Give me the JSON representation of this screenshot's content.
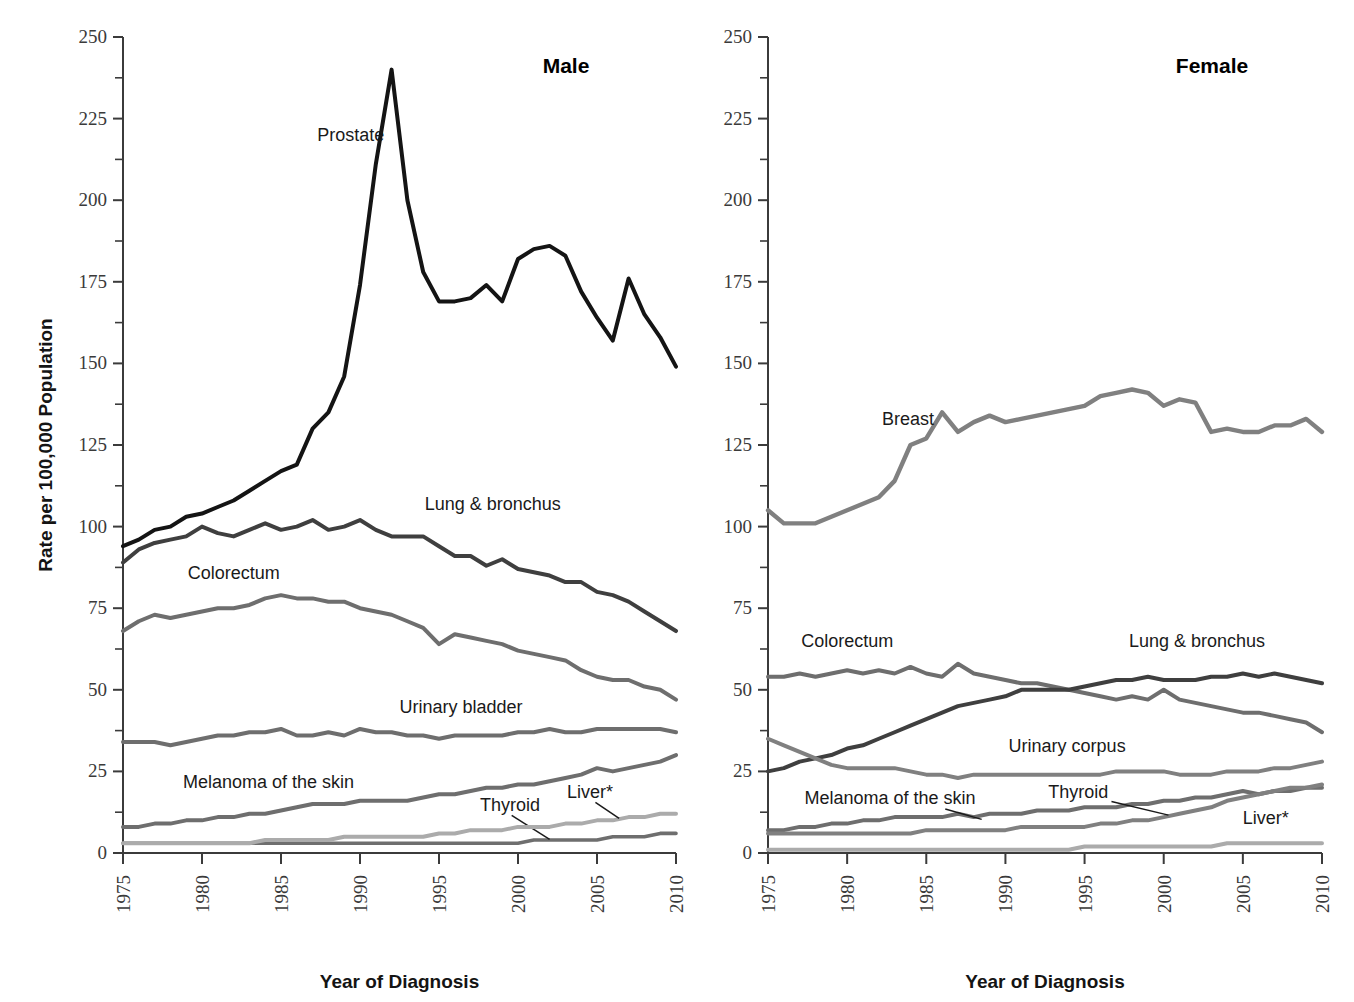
{
  "figure": {
    "y_axis_label": "Rate per 100,000 Population",
    "x_axis_label_male": "Year of Diagnosis",
    "x_axis_label_female": "Year of Diagnosis",
    "panel_title_male": "Male",
    "panel_title_female": "Female"
  },
  "axis": {
    "y_ticks": [
      "0",
      "25",
      "50",
      "75",
      "100",
      "125",
      "150",
      "175",
      "200",
      "225",
      "250"
    ],
    "x_ticks": [
      "1975",
      "1980",
      "1985",
      "1990",
      "1995",
      "2000",
      "2005",
      "2010"
    ]
  },
  "colors": {
    "black": "#141414",
    "dark_gray": "#3f3f3f",
    "mid_gray": "#6e6e6e",
    "gray": "#808080",
    "light_gray": "#9a9a9a",
    "lighter_gray": "#ababab",
    "lightest_gray": "#bdbdbd"
  },
  "chart_data": [
    {
      "type": "line",
      "title": "Male",
      "xlabel": "Year of Diagnosis",
      "ylabel": "Rate per 100,000 Population",
      "xlim": [
        1975,
        2010
      ],
      "ylim": [
        0,
        250
      ],
      "ytick_step": 25,
      "yminor_step": 12.5,
      "xtick_step": 5,
      "grid": false,
      "legend": "inline-annotations",
      "x": [
        1975,
        1976,
        1977,
        1978,
        1979,
        1980,
        1981,
        1982,
        1983,
        1984,
        1985,
        1986,
        1987,
        1988,
        1989,
        1990,
        1991,
        1992,
        1993,
        1994,
        1995,
        1996,
        1997,
        1998,
        1999,
        2000,
        2001,
        2002,
        2003,
        2004,
        2005,
        2006,
        2007,
        2008,
        2009,
        2010
      ],
      "series": [
        {
          "name": "Prostate",
          "color": "#141414",
          "width": 4.0,
          "label_x": 1987.3,
          "label_y": 218,
          "values": [
            94,
            96,
            99,
            100,
            103,
            104,
            106,
            108,
            111,
            114,
            117,
            119,
            130,
            135,
            146,
            174,
            211,
            240,
            200,
            178,
            169,
            169,
            170,
            174,
            169,
            182,
            185,
            186,
            183,
            172,
            164,
            157,
            176,
            165,
            158,
            149
          ]
        },
        {
          "name": "Lung & bronchus",
          "color": "#3f3f3f",
          "width": 4.0,
          "label_x": 1994.1,
          "label_y": 105,
          "values": [
            89,
            93,
            95,
            96,
            97,
            100,
            98,
            97,
            99,
            101,
            99,
            100,
            102,
            99,
            100,
            102,
            99,
            97,
            97,
            97,
            94,
            91,
            91,
            88,
            90,
            87,
            86,
            85,
            83,
            83,
            80,
            79,
            77,
            74,
            71,
            68
          ]
        },
        {
          "name": "Colorectum",
          "color": "#6e6e6e",
          "width": 4.0,
          "label_x": 1979.1,
          "label_y": 84,
          "values": [
            68,
            71,
            73,
            72,
            73,
            74,
            75,
            75,
            76,
            78,
            79,
            78,
            78,
            77,
            77,
            75,
            74,
            73,
            71,
            69,
            64,
            67,
            66,
            65,
            64,
            62,
            61,
            60,
            59,
            56,
            54,
            53,
            53,
            51,
            50,
            47
          ]
        },
        {
          "name": "Urinary bladder",
          "color": "#6e6e6e",
          "width": 4.0,
          "label_x": 1992.5,
          "label_y": 43,
          "values": [
            34,
            34,
            34,
            33,
            34,
            35,
            36,
            36,
            37,
            37,
            38,
            36,
            36,
            37,
            36,
            38,
            37,
            37,
            36,
            36,
            35,
            36,
            36,
            36,
            36,
            37,
            37,
            38,
            37,
            37,
            38,
            38,
            38,
            38,
            38,
            37
          ]
        },
        {
          "name": "Melanoma of the skin",
          "color": "#6e6e6e",
          "width": 4.0,
          "label_x": 1978.8,
          "label_y": 20,
          "values": [
            8,
            8,
            9,
            9,
            10,
            10,
            11,
            11,
            12,
            12,
            13,
            14,
            15,
            15,
            15,
            16,
            16,
            16,
            16,
            17,
            18,
            18,
            19,
            20,
            20,
            21,
            21,
            22,
            23,
            24,
            26,
            25,
            26,
            27,
            28,
            30
          ]
        },
        {
          "name": "Thyroid",
          "color": "#6e6e6e",
          "width": 3.6,
          "label_x": 1997.6,
          "label_y": 13,
          "leader": {
            "x1": 1999.6,
            "y1": 11.5,
            "x2": 2002.0,
            "y2": 4.2
          },
          "values": [
            3,
            3,
            3,
            3,
            3,
            3,
            3,
            3,
            3,
            3,
            3,
            3,
            3,
            3,
            3,
            3,
            3,
            3,
            3,
            3,
            3,
            3,
            3,
            3,
            3,
            3,
            4,
            4,
            4,
            4,
            4,
            5,
            5,
            5,
            6,
            6
          ]
        },
        {
          "name": "Liver*",
          "color": "#ababab",
          "width": 4.0,
          "label_x": 2003.1,
          "label_y": 17,
          "leader": {
            "x1": 2004.9,
            "y1": 15.5,
            "x2": 2006.4,
            "y2": 10.6
          },
          "values": [
            3,
            3,
            3,
            3,
            3,
            3,
            3,
            3,
            3,
            4,
            4,
            4,
            4,
            4,
            5,
            5,
            5,
            5,
            5,
            5,
            6,
            6,
            7,
            7,
            7,
            8,
            8,
            8,
            9,
            9,
            10,
            10,
            11,
            11,
            12,
            12
          ]
        }
      ]
    },
    {
      "type": "line",
      "title": "Female",
      "xlabel": "Year of Diagnosis",
      "ylabel": "Rate per 100,000 Population",
      "xlim": [
        1975,
        2010
      ],
      "ylim": [
        0,
        250
      ],
      "ytick_step": 25,
      "yminor_step": 12.5,
      "xtick_step": 5,
      "grid": false,
      "legend": "inline-annotations",
      "x": [
        1975,
        1976,
        1977,
        1978,
        1979,
        1980,
        1981,
        1982,
        1983,
        1984,
        1985,
        1986,
        1987,
        1988,
        1989,
        1990,
        1991,
        1992,
        1993,
        1994,
        1995,
        1996,
        1997,
        1998,
        1999,
        2000,
        2001,
        2002,
        2003,
        2004,
        2005,
        2006,
        2007,
        2008,
        2009,
        2010
      ],
      "series": [
        {
          "name": "Breast",
          "color": "#808080",
          "width": 4.4,
          "label_x": 1982.2,
          "label_y": 131,
          "values": [
            105,
            101,
            101,
            101,
            103,
            105,
            107,
            109,
            114,
            125,
            127,
            135,
            129,
            132,
            134,
            132,
            133,
            134,
            135,
            136,
            137,
            140,
            141,
            142,
            141,
            137,
            139,
            138,
            129,
            130,
            129,
            129,
            131,
            131,
            133,
            129
          ]
        },
        {
          "name": "Colorectum",
          "color": "#6e6e6e",
          "width": 4.0,
          "label_x": 1977.1,
          "label_y": 63,
          "values": [
            54,
            54,
            55,
            54,
            55,
            56,
            55,
            56,
            55,
            57,
            55,
            54,
            58,
            55,
            54,
            53,
            52,
            52,
            51,
            50,
            49,
            48,
            47,
            48,
            47,
            50,
            47,
            46,
            45,
            44,
            43,
            43,
            42,
            41,
            40,
            37
          ]
        },
        {
          "name": "Lung & bronchus",
          "color": "#3f3f3f",
          "width": 4.0,
          "label_x": 1997.8,
          "label_y": 63,
          "values": [
            25,
            26,
            28,
            29,
            30,
            32,
            33,
            35,
            37,
            39,
            41,
            43,
            45,
            46,
            47,
            48,
            50,
            50,
            50,
            50,
            51,
            52,
            53,
            53,
            54,
            53,
            53,
            53,
            54,
            54,
            55,
            54,
            55,
            54,
            53,
            52
          ]
        },
        {
          "name": "Urinary corpus",
          "color": "#808080",
          "width": 4.0,
          "label_x": 1990.2,
          "label_y": 31,
          "values": [
            35,
            33,
            31,
            29,
            27,
            26,
            26,
            26,
            26,
            25,
            24,
            24,
            23,
            24,
            24,
            24,
            24,
            24,
            24,
            24,
            24,
            24,
            25,
            25,
            25,
            25,
            24,
            24,
            24,
            25,
            25,
            25,
            26,
            26,
            27,
            28
          ]
        },
        {
          "name": "Melanoma of the skin",
          "color": "#6e6e6e",
          "width": 4.0,
          "label_x": 1977.3,
          "label_y": 15,
          "leader": {
            "x1": 1986.2,
            "y1": 13.5,
            "x2": 1988.5,
            "y2": 10.3
          },
          "values": [
            7,
            7,
            8,
            8,
            9,
            9,
            10,
            10,
            11,
            11,
            11,
            11,
            12,
            11,
            12,
            12,
            12,
            13,
            13,
            13,
            14,
            14,
            14,
            15,
            15,
            16,
            16,
            17,
            17,
            18,
            19,
            18,
            19,
            19,
            20,
            20
          ]
        },
        {
          "name": "Thyroid",
          "color": "#808080",
          "width": 4.0,
          "label_x": 1992.7,
          "label_y": 17,
          "leader": {
            "x1": 1996.7,
            "y1": 15.8,
            "x2": 2000.3,
            "y2": 11.6
          },
          "values": [
            6,
            6,
            6,
            6,
            6,
            6,
            6,
            6,
            6,
            6,
            7,
            7,
            7,
            7,
            7,
            7,
            8,
            8,
            8,
            8,
            8,
            9,
            9,
            10,
            10,
            11,
            12,
            13,
            14,
            16,
            17,
            18,
            19,
            20,
            20,
            21
          ]
        },
        {
          "name": "Liver*",
          "color": "#ababab",
          "width": 4.0,
          "label_x": 2005.0,
          "label_y": 9,
          "values": [
            1,
            1,
            1,
            1,
            1,
            1,
            1,
            1,
            1,
            1,
            1,
            1,
            1,
            1,
            1,
            1,
            1,
            1,
            1,
            1,
            2,
            2,
            2,
            2,
            2,
            2,
            2,
            2,
            2,
            3,
            3,
            3,
            3,
            3,
            3,
            3
          ]
        }
      ]
    }
  ]
}
